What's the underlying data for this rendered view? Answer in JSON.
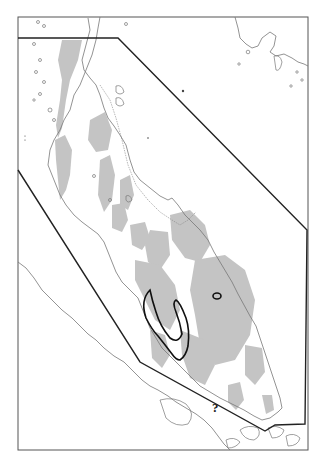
{
  "map": {
    "title": "",
    "region": "Malay Peninsula",
    "frame": {
      "x": 18,
      "y": 17,
      "width": 290,
      "height": 433
    },
    "colors": {
      "frame": "#555555",
      "coastline": "#777777",
      "highland_fill": "#c4c4c4",
      "hull_polygon": "#222222",
      "range_outline": "#111111"
    },
    "annotations": [
      {
        "label": "?",
        "x": 216,
        "y": 410
      }
    ],
    "legend": []
  }
}
